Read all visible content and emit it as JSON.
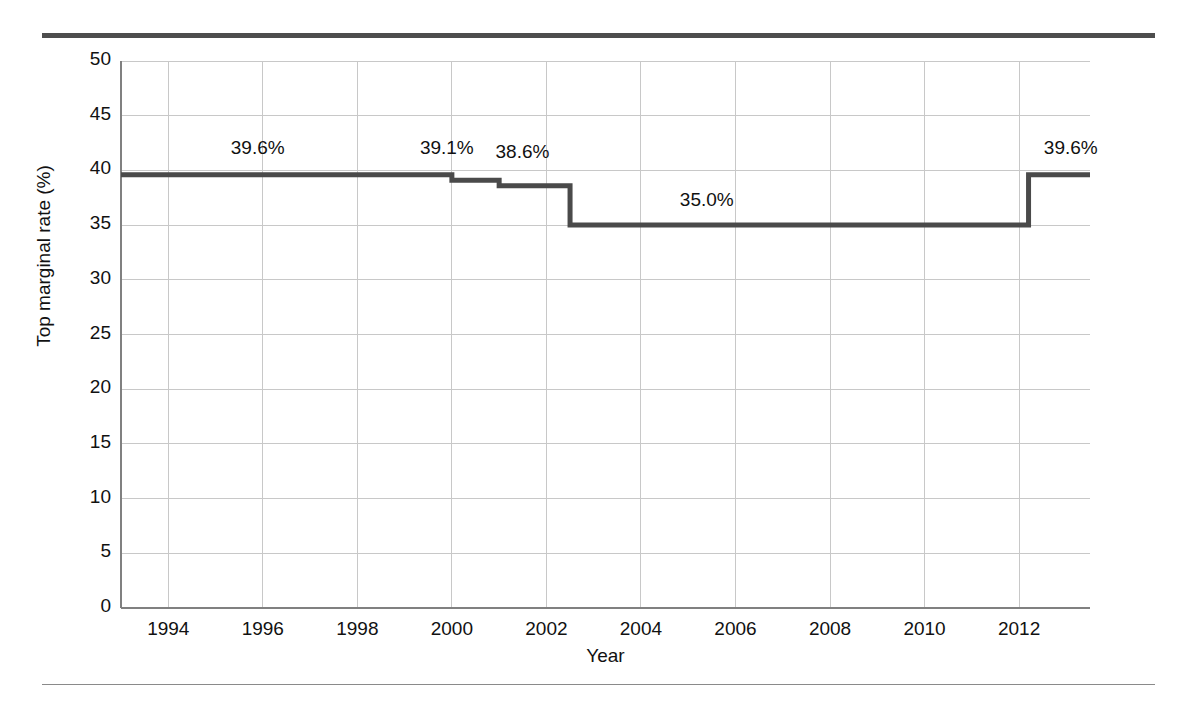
{
  "figure": {
    "background_color": "#ffffff",
    "rule_color_top": "#4d4d4d",
    "rule_color_bottom": "#8a8a8a"
  },
  "chart_data": {
    "type": "line",
    "line_style": "step-post",
    "title": "",
    "subtitle": "",
    "xlabel": "Year",
    "ylabel": "Top marginal rate (%)",
    "xlim": [
      1993,
      2013.5
    ],
    "ylim": [
      0,
      50
    ],
    "grid": true,
    "legend": "none",
    "line_color": "#4a4a4a",
    "grid_color": "#c8c8c8",
    "axis_color": "#808080",
    "x_ticks": [
      1994,
      1996,
      1998,
      2000,
      2002,
      2004,
      2006,
      2008,
      2010,
      2012
    ],
    "x_tick_labels": [
      "1994",
      "1996",
      "1998",
      "2000",
      "2002",
      "2004",
      "2006",
      "2008",
      "2010",
      "2012"
    ],
    "y_ticks": [
      0,
      5,
      10,
      15,
      20,
      25,
      30,
      35,
      40,
      45,
      50
    ],
    "y_tick_labels": [
      "0",
      "5",
      "10",
      "15",
      "20",
      "25",
      "30",
      "35",
      "40",
      "45",
      "50"
    ],
    "x": [
      1993,
      2000,
      2001,
      2002,
      2002.5,
      2012.2,
      2013.5
    ],
    "y": [
      39.6,
      39.6,
      39.1,
      38.6,
      35.0,
      35.0,
      39.6
    ],
    "steps": [
      {
        "x_start": 1993,
        "x_end": 2000,
        "value": 39.6
      },
      {
        "x_start": 2000,
        "x_end": 2001,
        "value": 39.1
      },
      {
        "x_start": 2001,
        "x_end": 2002.5,
        "value": 38.6
      },
      {
        "x_start": 2002.5,
        "x_end": 2012.2,
        "value": 35.0
      },
      {
        "x_start": 2012.2,
        "x_end": 2013.5,
        "value": 39.6
      }
    ],
    "annotations": [
      {
        "text": "39.6%",
        "x": 1996.0,
        "y": 42.0
      },
      {
        "text": "39.1%",
        "x": 2000.0,
        "y": 42.0
      },
      {
        "text": "38.6%",
        "x": 2001.6,
        "y": 41.6
      },
      {
        "text": "35.0%",
        "x": 2005.5,
        "y": 37.2
      },
      {
        "text": "39.6%",
        "x": 2013.2,
        "y": 42.0
      }
    ]
  }
}
